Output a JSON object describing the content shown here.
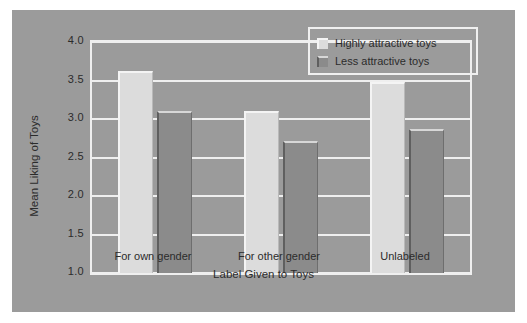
{
  "chart_data": {
    "type": "bar",
    "title": "",
    "xlabel": "Label Given to Toys",
    "ylabel": "Mean Liking of Toys",
    "categories": [
      "For own gender",
      "For other gender",
      "Unlabeled"
    ],
    "series": [
      {
        "name": "Highly attractive toys",
        "values": [
          3.63,
          3.1,
          3.48
        ],
        "color": "#dcdcdc"
      },
      {
        "name": "Less attractive toys",
        "values": [
          3.1,
          2.72,
          2.87
        ],
        "color": "#8b8b8b"
      }
    ],
    "ylim": [
      1.0,
      4.0
    ],
    "yticks": [
      "1.0",
      "1.5",
      "2.0",
      "2.5",
      "3.0",
      "3.5",
      "4.0"
    ],
    "ytick_values": [
      1.0,
      1.5,
      2.0,
      2.5,
      3.0,
      3.5,
      4.0
    ],
    "grid": true,
    "legend_position": "top-right",
    "background_color": "#9b9b9b",
    "gridline_color": "#efefef",
    "text_color": "#2b2b2b"
  },
  "legend": {
    "entries": [
      {
        "label": "Highly attractive toys",
        "swatch": "light-swatch-icon"
      },
      {
        "label": "Less attractive toys",
        "swatch": "dark-swatch-icon"
      }
    ]
  }
}
